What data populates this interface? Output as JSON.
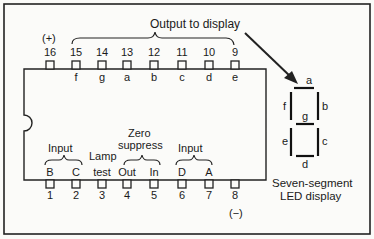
{
  "title": "Output to display",
  "power_label": "(+)",
  "ground_label": "(−)",
  "top_pins": [
    {
      "num": "16",
      "name": ""
    },
    {
      "num": "15",
      "name": "f"
    },
    {
      "num": "14",
      "name": "g"
    },
    {
      "num": "13",
      "name": "a"
    },
    {
      "num": "12",
      "name": "b"
    },
    {
      "num": "11",
      "name": "c"
    },
    {
      "num": "10",
      "name": "d"
    },
    {
      "num": "9",
      "name": "e"
    }
  ],
  "bottom_pins": [
    {
      "num": "1",
      "name": "B"
    },
    {
      "num": "2",
      "name": "C"
    },
    {
      "num": "3",
      "name": "test"
    },
    {
      "num": "4",
      "name": "Out"
    },
    {
      "num": "5",
      "name": "In"
    },
    {
      "num": "6",
      "name": "D"
    },
    {
      "num": "7",
      "name": "A"
    },
    {
      "num": "8",
      "name": ""
    }
  ],
  "groups": {
    "input_left": "Input",
    "lamp": "Lamp",
    "zero_line1": "Zero",
    "zero_line2": "suppress",
    "input_right": "Input"
  },
  "display": {
    "segments": [
      "a",
      "b",
      "c",
      "d",
      "e",
      "f",
      "g"
    ],
    "caption_line1": "Seven-segment",
    "caption_line2": "LED display"
  }
}
